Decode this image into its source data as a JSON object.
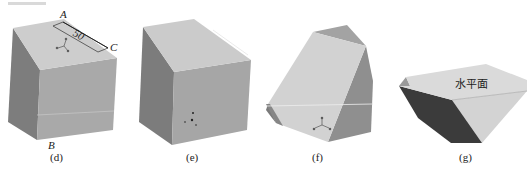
{
  "figure": {
    "header_fragment": "",
    "panels": [
      {
        "id": "d",
        "caption": "(d)",
        "shape": "cube",
        "labels": {
          "A": "A",
          "B": "B",
          "C": "C"
        },
        "dimension": "50",
        "has_axis_triad": true
      },
      {
        "id": "e",
        "caption": "(e)",
        "shape": "cube",
        "has_axis_triad": true
      },
      {
        "id": "f",
        "caption": "(f)",
        "shape": "cube-with-cut-corners",
        "has_axis_triad": true
      },
      {
        "id": "g",
        "caption": "(g)",
        "shape": "truncated-solid",
        "face_label": "水平面"
      }
    ],
    "colors": {
      "top_face": "#cfcfcf",
      "front_face": "#a8a8a8",
      "left_face": "#7c7c7c",
      "dark_face": "#3a3a3a",
      "light_face": "#d6d6d6",
      "edge": "#9a9a9a",
      "text": "#222222"
    }
  }
}
